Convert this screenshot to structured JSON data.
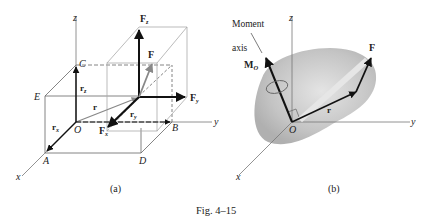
{
  "figure": {
    "caption": "Fig. 4–15",
    "panels": [
      {
        "id": "a",
        "label": "(a)",
        "axes": {
          "x": "x",
          "y": "y",
          "z": "z"
        },
        "points": {
          "O": "O",
          "A": "A",
          "B": "B",
          "C": "C",
          "D": "D",
          "E": "E"
        },
        "vectors": {
          "r": "r",
          "rx": "r",
          "rx_sub": "x",
          "ry": "r",
          "ry_sub": "y",
          "rz": "r",
          "rz_sub": "z",
          "F": "F",
          "Fx": "F",
          "Fx_sub": "x",
          "Fy": "F",
          "Fy_sub": "y",
          "Fz": "F",
          "Fz_sub": "z"
        }
      },
      {
        "id": "b",
        "label": "(b)",
        "axes": {
          "x": "x",
          "y": "y",
          "z": "z"
        },
        "origin": "O",
        "annotation_line1": "Moment",
        "annotation_line2": "axis",
        "vectors": {
          "MO": "M",
          "MO_sub": "O",
          "r": "r",
          "F": "F"
        }
      }
    ]
  },
  "colors": {
    "axis": "#777777",
    "vector": "#111111",
    "box": "#9a9a9a",
    "body_shade": "#c8c8c8"
  }
}
